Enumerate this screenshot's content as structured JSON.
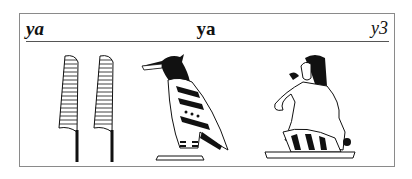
{
  "entry": {
    "transliteration_left": "ya",
    "title": "ya",
    "transliteration_right": "y3"
  },
  "glyphs": [
    {
      "name": "double-reed-leaf",
      "description": "two flowering reeds"
    },
    {
      "name": "vulture-bird",
      "description": "bird"
    },
    {
      "name": "seated-man-hand-to-mouth",
      "description": "man with hand to mouth"
    }
  ]
}
